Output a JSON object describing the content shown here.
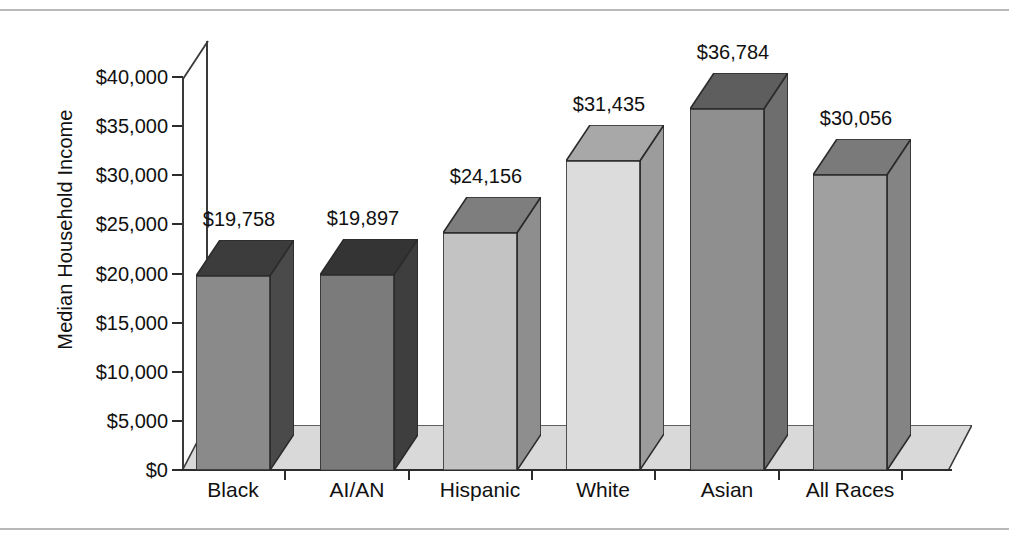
{
  "chart_data": {
    "type": "bar",
    "title": "",
    "xlabel": "",
    "ylabel": "Median Household Income",
    "categories": [
      "Black",
      "AI/AN",
      "Hispanic",
      "White",
      "Asian",
      "All Races"
    ],
    "values": [
      19758,
      19897,
      24156,
      31435,
      36784,
      30056
    ],
    "value_labels": [
      "$19,758",
      "$19,897",
      "$24,156",
      "$31,435",
      "$36,784",
      "$30,056"
    ],
    "ylim": [
      0,
      40000
    ],
    "ytick_values": [
      0,
      5000,
      10000,
      15000,
      20000,
      25000,
      30000,
      35000,
      40000
    ],
    "ytick_labels": [
      "$0",
      "$5,000",
      "$10,000",
      "$15,000",
      "$20,000",
      "$25,000",
      "$30,000",
      "$35,000",
      "$40,000"
    ],
    "grid": false,
    "legend": "none",
    "style": "3d-column",
    "bar_colors": [
      "#8a8a8a",
      "#7b7b7b",
      "#c3c3c3",
      "#dcdcdc",
      "#8f8f8f",
      "#a0a0a0"
    ],
    "bar_side_colors": [
      "#4a4a4a",
      "#3e3e3e",
      "#8e8e8e",
      "#9c9c9c",
      "#6e6e6e",
      "#848484"
    ],
    "bar_top_colors": [
      "#3c3c3c",
      "#343434",
      "#7e7e7e",
      "#a8a8a8",
      "#5e5e5e",
      "#7a7a7a"
    ]
  },
  "axis": {
    "y_title": "Median Household Income"
  },
  "colors": {
    "axis_line": "#2c2c2c",
    "floor": "#d9d9d9",
    "page_rule": "#b9b9b9",
    "text": "#111111"
  }
}
